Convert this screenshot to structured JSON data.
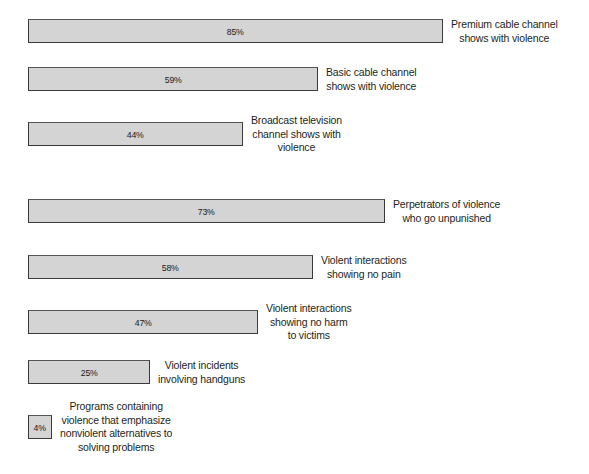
{
  "chart_data": {
    "type": "bar",
    "orientation": "horizontal",
    "title": "",
    "subtitle": "",
    "xlabel": "",
    "ylabel": "",
    "xlim": [
      0,
      100
    ],
    "grid": false,
    "legend": null,
    "units": "percent",
    "categories": [
      "Premium cable channel shows with violence",
      "Basic cable channel shows with violence",
      "Broadcast television channel shows with violence",
      "Perpetrators of violence who go unpunished",
      "Violent interactions showing no pain",
      "Violent interactions showing no harm to victims",
      "Violent incidents involving handguns",
      "Programs containing violence that emphasize nonviolent alternatives to solving problems"
    ],
    "values": [
      85,
      59,
      44,
      73,
      58,
      47,
      25,
      4
    ],
    "value_labels": [
      "85%",
      "59%",
      "44%",
      "73%",
      "58%",
      "47%",
      "25%",
      "4%"
    ]
  },
  "style": {
    "bar_fill": "#d4d4d4",
    "bar_border": "#3a3a3a",
    "text_color": "#231f20",
    "background": "#ffffff"
  },
  "bars": [
    {
      "value_label": "85%",
      "value": 85,
      "top": 19,
      "width": 415,
      "label_lines": [
        "Premium cable channel",
        "shows with violence"
      ],
      "label_left": 451
    },
    {
      "value_label": "59%",
      "value": 59,
      "top": 67,
      "width": 290,
      "label_lines": [
        "Basic cable channel",
        "shows with violence"
      ],
      "label_left": 326
    },
    {
      "value_label": "44%",
      "value": 44,
      "top": 122,
      "width": 215,
      "label_lines": [
        "Broadcast television",
        "channel shows with",
        "violence"
      ],
      "label_left": 251
    },
    {
      "value_label": "73%",
      "value": 73,
      "top": 199,
      "width": 357,
      "label_lines": [
        "Perpetrators of violence",
        "who go unpunished"
      ],
      "label_left": 393
    },
    {
      "value_label": "58%",
      "value": 58,
      "top": 255,
      "width": 285,
      "label_lines": [
        "Violent interactions",
        "showing no pain"
      ],
      "label_left": 321
    },
    {
      "value_label": "47%",
      "value": 47,
      "top": 310,
      "width": 230,
      "label_lines": [
        "Violent interactions",
        "showing no harm",
        "to victims"
      ],
      "label_left": 266
    },
    {
      "value_label": "25%",
      "value": 25,
      "top": 360,
      "width": 122,
      "label_lines": [
        "Violent incidents",
        "involving handguns"
      ],
      "label_left": 158
    },
    {
      "value_label": "4%",
      "value": 4,
      "top": 415,
      "width": 24,
      "label_lines": [
        "Programs containing",
        "violence that emphasize",
        "nonviolent alternatives to",
        "solving problems"
      ],
      "label_left": 60
    }
  ]
}
